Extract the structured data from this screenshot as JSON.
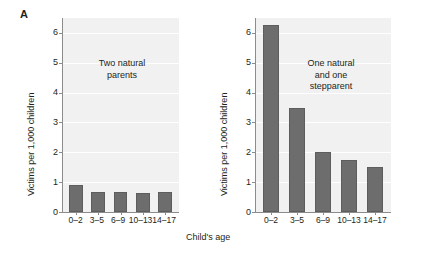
{
  "figure": {
    "panel_label": "A",
    "xaxis_title": "Child's age",
    "bar_color": "#6d6d6d",
    "plot_bg": "#f1f1f1",
    "gridline_color": "#ffffff",
    "axis_color": "#8c8c8c"
  },
  "chart_data": [
    {
      "type": "bar",
      "title": "",
      "annotation": "Two natural\nparents",
      "categories": [
        "0–2",
        "3–5",
        "6–9",
        "10–13",
        "14–17"
      ],
      "values": [
        0.9,
        0.67,
        0.67,
        0.63,
        0.67
      ],
      "xlabel": "Child's age",
      "ylabel": "Victims per 1,000 children",
      "ylim": [
        0,
        6.5
      ],
      "yticks": [
        0,
        1,
        2,
        3,
        4,
        5,
        6
      ],
      "ytick_labels": [
        "0",
        "1",
        "2",
        "3",
        "4",
        "5",
        "6"
      ],
      "grid": true,
      "legend": "none"
    },
    {
      "type": "bar",
      "title": "",
      "annotation": "One natural\nand one\nstepparent",
      "categories": [
        "0–2",
        "3–5",
        "6–9",
        "10–13",
        "14–17"
      ],
      "values": [
        6.25,
        3.5,
        2.02,
        1.75,
        1.5
      ],
      "xlabel": "Child's age",
      "ylabel": "Victims per 1,000 children",
      "ylim": [
        0,
        6.5
      ],
      "yticks": [
        0,
        1,
        2,
        3,
        4,
        5,
        6
      ],
      "ytick_labels": [
        "0",
        "1",
        "2",
        "3",
        "4",
        "5",
        "6"
      ],
      "grid": true,
      "legend": "none"
    }
  ]
}
